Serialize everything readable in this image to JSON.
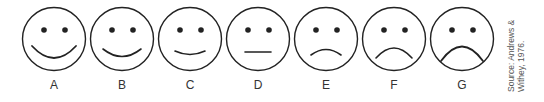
{
  "faces": [
    {
      "label": "A",
      "mouth": "M 11 40 Q 33 64 55 40"
    },
    {
      "label": "B",
      "mouth": "M 14 43 Q 33 58 52 43"
    },
    {
      "label": "C",
      "mouth": "M 18 45 Q 33 52 48 45"
    },
    {
      "label": "D",
      "mouth": "M 20 46 L 46 46"
    },
    {
      "label": "E",
      "mouth": "M 18 49 Q 33 38 48 49"
    },
    {
      "label": "F",
      "mouth": "M 15 52 Q 33 32 51 52"
    },
    {
      "label": "G",
      "mouth": "M 12 55 Q 33 26 54 55"
    }
  ],
  "source": {
    "line1": "Source: Andrews &",
    "line2": "Withey, 1976."
  },
  "colors": {
    "stroke": "#222222"
  }
}
